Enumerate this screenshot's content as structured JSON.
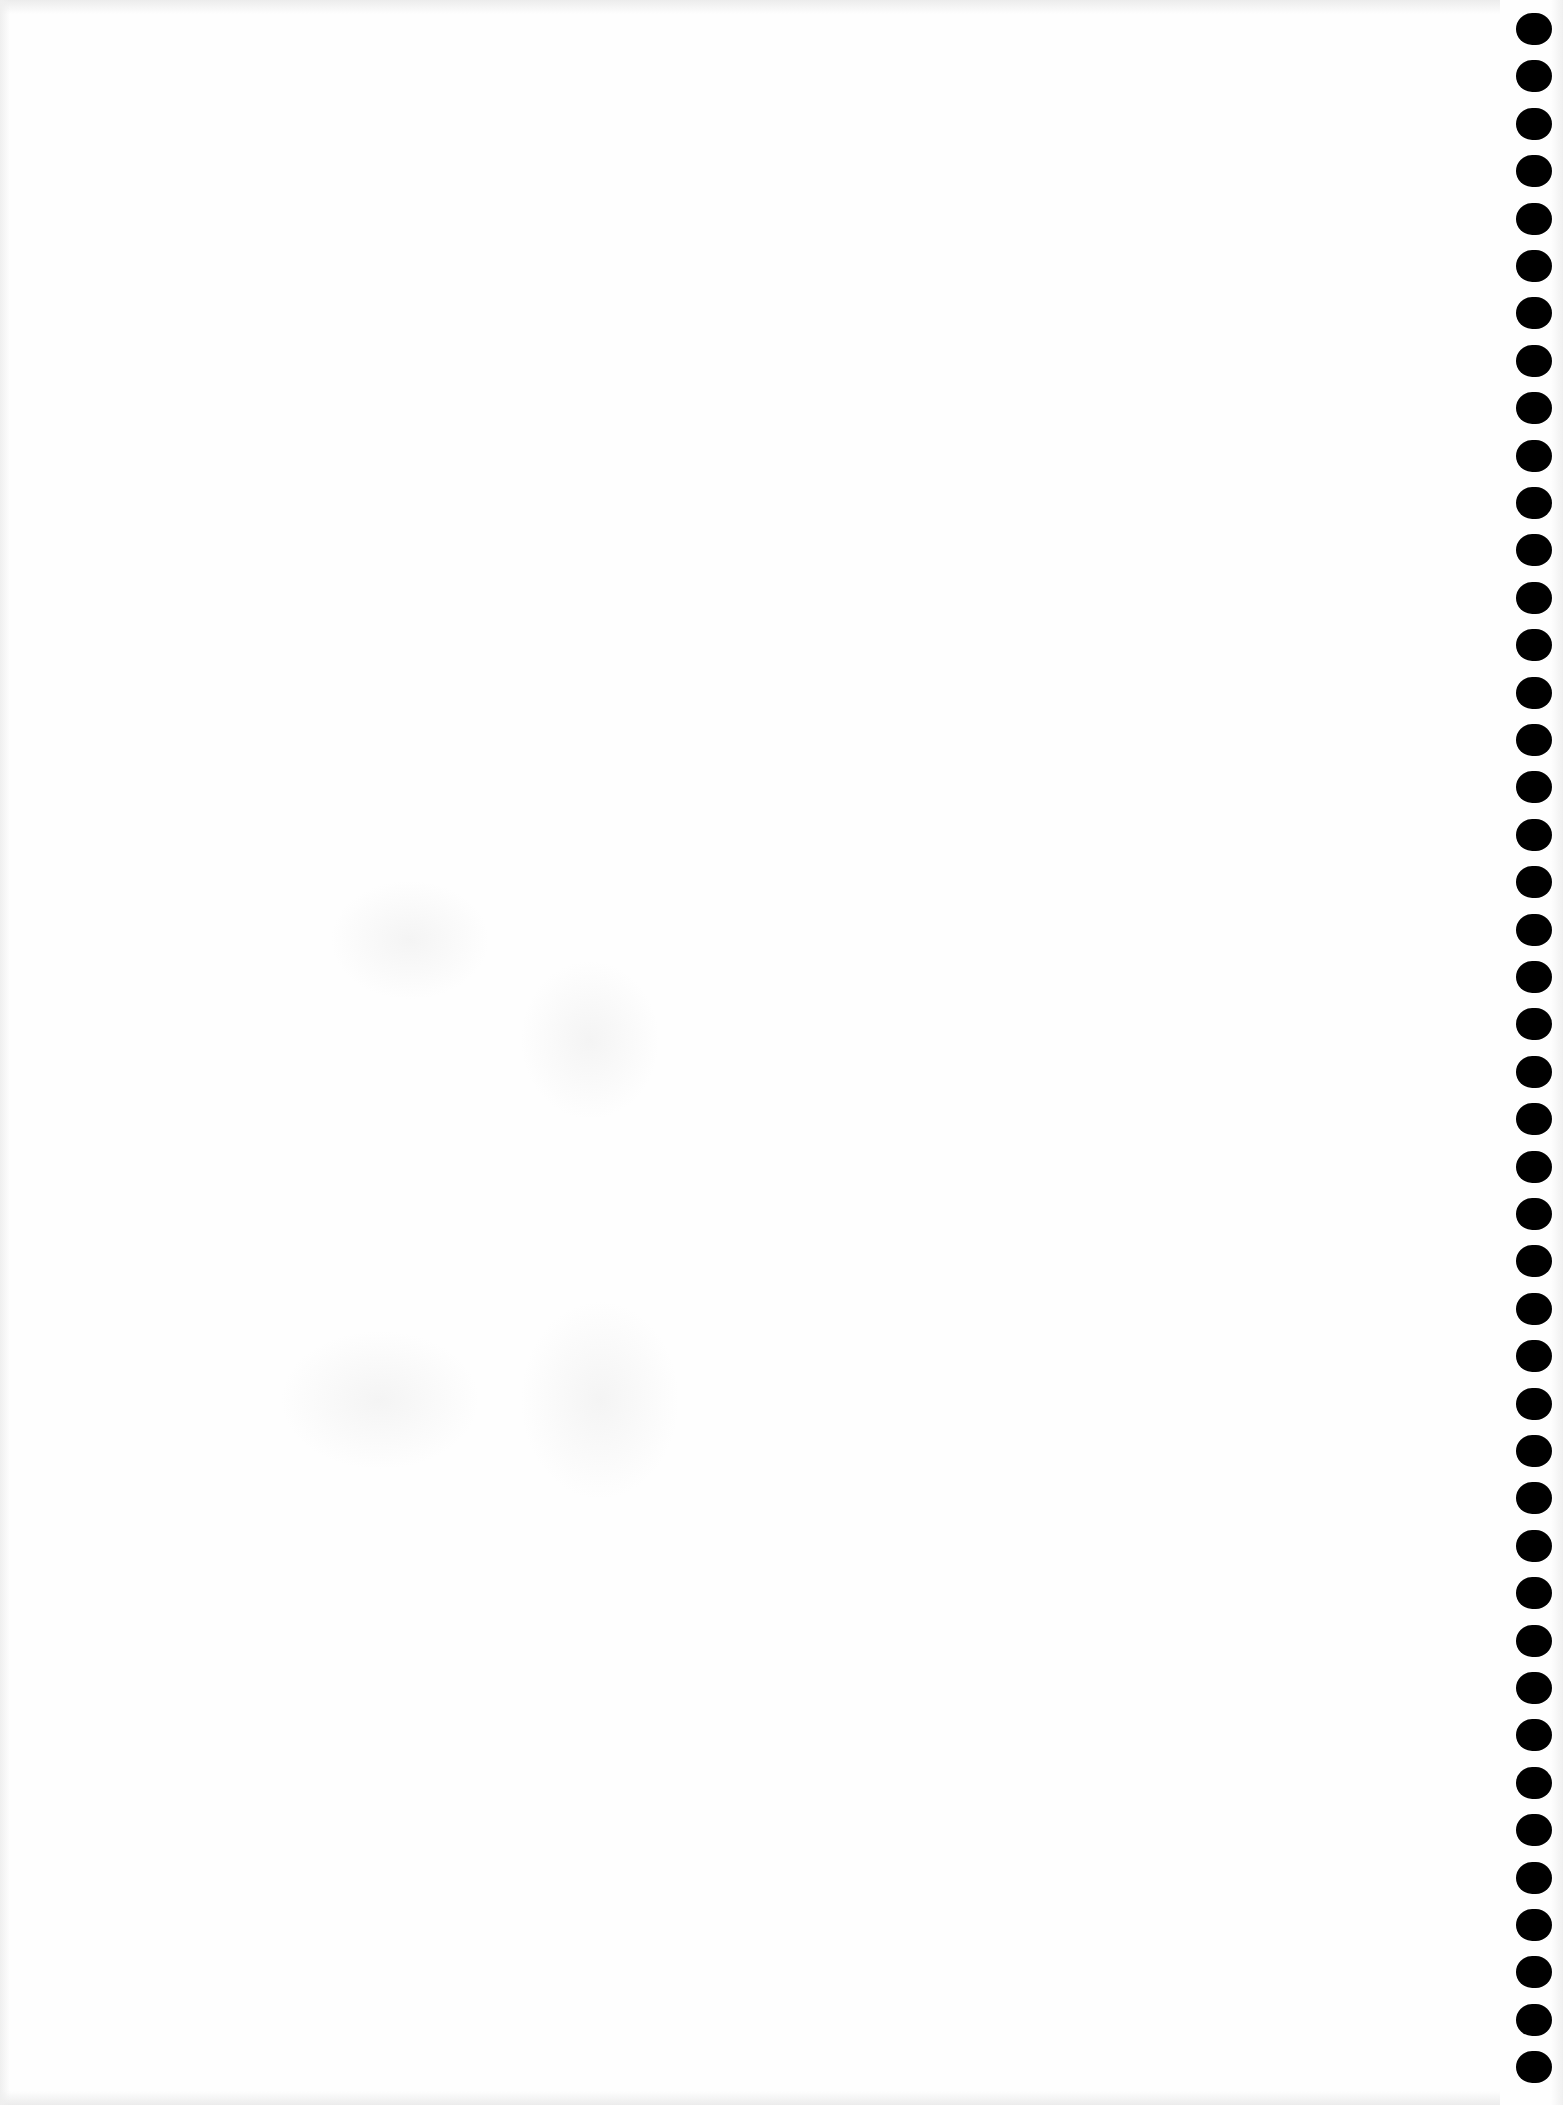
{
  "page": {
    "type": "blank-notebook-page",
    "background_color": "#fefefe",
    "text": ""
  },
  "binding": {
    "side": "right",
    "hole_color": "#000000",
    "hole_count": 44,
    "first_hole_top": 13,
    "hole_pitch": 47.4,
    "hole_width": 36,
    "hole_height": 32
  }
}
